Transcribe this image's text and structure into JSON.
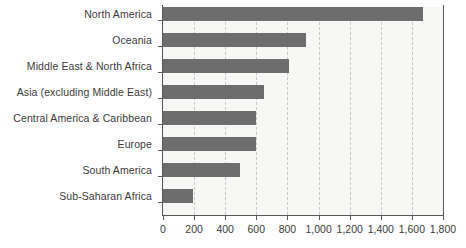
{
  "chart_data": {
    "type": "bar",
    "orientation": "horizontal",
    "title": "",
    "subtitle": "",
    "xlabel": "",
    "ylabel": "",
    "xlim": [
      0,
      1800
    ],
    "grid": "vertical-dashed",
    "legend": "none",
    "categories": [
      "North America",
      "Oceania",
      "Middle East & North Africa",
      "Asia (excluding Middle East)",
      "Central America & Caribbean",
      "Europe",
      "South America",
      "Sub-Saharan Africa"
    ],
    "values": [
      1670,
      920,
      810,
      650,
      600,
      600,
      495,
      195
    ],
    "xticks": [
      0,
      200,
      400,
      600,
      800,
      1000,
      1200,
      1400,
      1600,
      1800
    ],
    "xtick_labels": [
      "0",
      "200",
      "400",
      "600",
      "800",
      "1,000",
      "1,200",
      "1,400",
      "1,600",
      "1,800"
    ],
    "colors": {
      "bar": "#6d6d6d",
      "plot_background": "#f7f7f5",
      "gridline": "#c9c9c9",
      "axis": "#585858",
      "text": "#3b3b3b"
    }
  }
}
